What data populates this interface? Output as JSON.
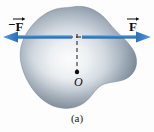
{
  "figure": {
    "caption": "(a)",
    "background_color": "#fdfdfd",
    "labels": {
      "force_left_sign": "−",
      "force_left_symbol": "F",
      "force_right_symbol": "F",
      "origin_symbol": "O"
    },
    "colors": {
      "arrow_blue": "#2f78c4",
      "arrow_blue_light": "#5fa0dc",
      "body_edge": "#6e7b88",
      "body_mid": "#9aa7b4",
      "body_light": "#f2f4f6",
      "dashed_line": "#1a1a1a",
      "text": "#0d0d0d"
    },
    "elements": {
      "body_name": "rigid-body-blob",
      "left_arrow_name": "force-arrow-left",
      "right_arrow_name": "force-arrow-right",
      "horizontal_dashed_name": "line-of-action-dashed",
      "vertical_dashed_name": "moment-arm-dashed",
      "origin_dot_name": "origin-point"
    },
    "geometry": {
      "arrow_y": 37,
      "left_arrow_tip_x": 3,
      "left_arrow_tail_x": 72,
      "right_arrow_tip_x": 151,
      "right_arrow_tail_x": 82,
      "origin_x": 77,
      "origin_y": 72
    }
  }
}
